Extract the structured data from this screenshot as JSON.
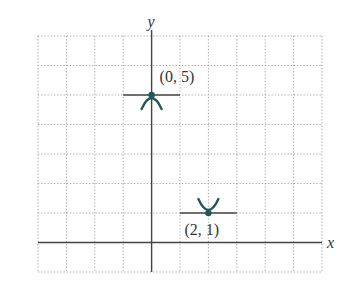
{
  "chart_data": {
    "type": "scatter",
    "title": "",
    "xlabel": "x",
    "ylabel": "y",
    "xlim": [
      -4,
      6
    ],
    "ylim": [
      -1,
      7
    ],
    "grid": true,
    "points": [
      {
        "x": 0,
        "y": 5,
        "label": "(0, 5)",
        "shape": "local maximum (concave down)"
      },
      {
        "x": 2,
        "y": 1,
        "label": "(2, 1)",
        "shape": "local minimum (concave up)"
      }
    ],
    "tangent_lines": [
      {
        "at": [
          0,
          5
        ],
        "x_from": -1,
        "x_to": 1
      },
      {
        "at": [
          2,
          1
        ],
        "x_from": 1,
        "x_to": 3
      }
    ]
  },
  "colors": {
    "curve": "#1f5a55",
    "axis": "#444444",
    "grid": "#a0a0a0"
  }
}
